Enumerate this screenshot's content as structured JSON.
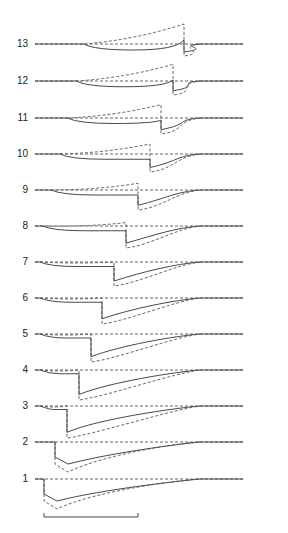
{
  "chart_data": {
    "type": "line",
    "title": "",
    "xlabel": "",
    "ylabel": "",
    "grid": false,
    "legend": null,
    "rows": [
      {
        "label": "1",
        "baseline_y": 479,
        "jump_x": 44
      },
      {
        "label": "2",
        "baseline_y": 442,
        "jump_x": 55
      },
      {
        "label": "3",
        "baseline_y": 406,
        "jump_x": 67
      },
      {
        "label": "4",
        "baseline_y": 370,
        "jump_x": 79
      },
      {
        "label": "5",
        "baseline_y": 334,
        "jump_x": 91
      },
      {
        "label": "6",
        "baseline_y": 298,
        "jump_x": 102
      },
      {
        "label": "7",
        "baseline_y": 262,
        "jump_x": 114
      },
      {
        "label": "8",
        "baseline_y": 226,
        "jump_x": 126
      },
      {
        "label": "9",
        "baseline_y": 190,
        "jump_x": 138
      },
      {
        "label": "10",
        "baseline_y": 154,
        "jump_x": 150
      },
      {
        "label": "11",
        "baseline_y": 118,
        "jump_x": 161
      },
      {
        "label": "12",
        "baseline_y": 81,
        "jump_x": 173
      },
      {
        "label": "13",
        "baseline_y": 44,
        "jump_x": 184
      }
    ],
    "x_range": [
      35,
      243
    ],
    "scale_bar": {
      "x1": 44,
      "x2": 138,
      "y": 517,
      "label": ""
    },
    "colors": {
      "solid": "#333333",
      "dashed": "#555555"
    }
  }
}
